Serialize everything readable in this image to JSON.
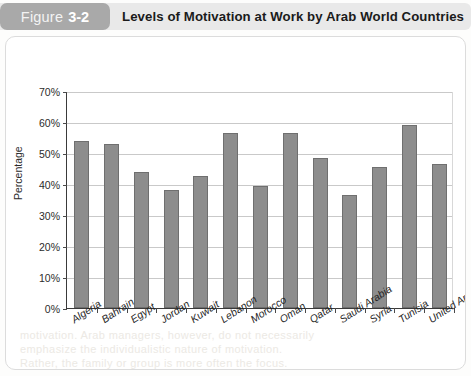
{
  "header": {
    "figure_word": "Figure",
    "figure_number": "3-2",
    "title": "Levels of Motivation at Work by Arab World Countries",
    "tab_color": "#a9a9a9",
    "band_color": "#e9e9e9"
  },
  "chart_data": {
    "type": "bar",
    "title": "Levels of Motivation at Work by Arab World Countries",
    "xlabel": "",
    "ylabel": "Percentage",
    "ylim": [
      0,
      70
    ],
    "ytick_step": 10,
    "ytick_labels": [
      "0%",
      "10%",
      "20%",
      "30%",
      "40%",
      "50%",
      "60%",
      "70%"
    ],
    "grid": true,
    "legend": "none",
    "bar_color": "#8d8d8d",
    "bar_border_color": "#6f6f6f",
    "categories": [
      "Algeria",
      "Bahrain",
      "Egypt",
      "Jordan",
      "Kuwait",
      "Lebanon",
      "Morocco",
      "Oman",
      "Qatar",
      "Saudi Arabia",
      "Syria",
      "Tunisia",
      "United Arab Emirates"
    ],
    "values": [
      54,
      53,
      44,
      38,
      42.5,
      56.5,
      39.5,
      56.5,
      48.5,
      36.5,
      45.5,
      59,
      46.5
    ]
  },
  "bleed_text": [
    "motivation. Arab managers, however, do not necessarily",
    "emphasize the individualistic nature of motivation.",
    "Rather, the family or group is more often the focus."
  ]
}
